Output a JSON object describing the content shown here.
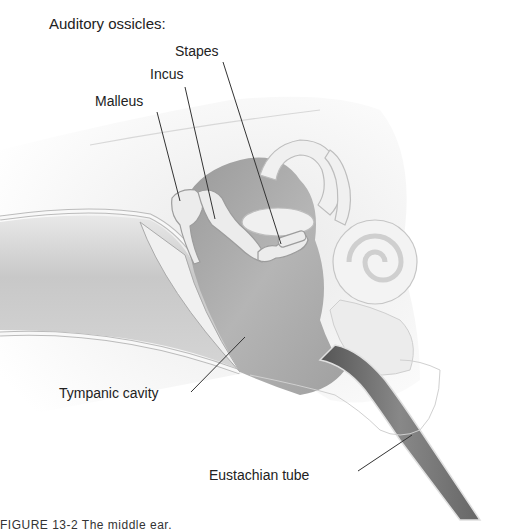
{
  "figure": {
    "title": "Auditory ossicles:",
    "labels": {
      "stapes": "Stapes",
      "incus": "Incus",
      "malleus": "Malleus",
      "tympanic_cavity": "Tympanic cavity",
      "eustachian_tube": "Eustachian tube"
    },
    "caption": "FIGURE 13-2  The middle ear."
  },
  "colors": {
    "background": "#ffffff",
    "bone_light": "#f2f2f2",
    "cavity_mid": "#b8b8b8",
    "cavity_dark": "#8a8a8a",
    "tube_dark": "#6a6a6a",
    "leader_line": "#333333",
    "text": "#222222"
  }
}
